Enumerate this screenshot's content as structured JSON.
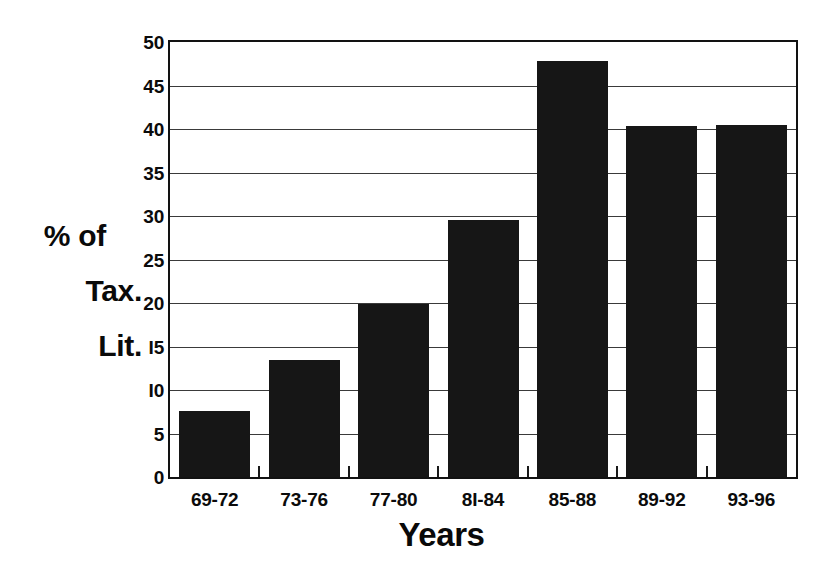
{
  "chart_data": {
    "type": "bar",
    "title": "",
    "subtitle": "",
    "xlabel": "Years",
    "ylabel": "% of Tax. Lit.",
    "ylabel_lines": [
      "% of",
      "Tax.",
      "Lit."
    ],
    "categories": [
      "69-72",
      "73-76",
      "77-80",
      "81-84",
      "85-88",
      "89-92",
      "93-96"
    ],
    "category_tick_labels": [
      "69-72",
      "73-76",
      "77-80",
      "8I-84",
      "85-88",
      "89-92",
      "93-96"
    ],
    "values": [
      7.6,
      13.5,
      19.9,
      29.6,
      47.8,
      40.4,
      40.5
    ],
    "ylim": [
      0,
      50
    ],
    "ytick_values": [
      0,
      5,
      10,
      15,
      20,
      25,
      30,
      35,
      40,
      45,
      50
    ],
    "ytick_labels": [
      "0",
      "5",
      "I0",
      "I5",
      "20",
      "25",
      "30",
      "35",
      "40",
      "45",
      "50"
    ],
    "grid": true,
    "grid_axis": "y",
    "legend": false,
    "legend_position": "none",
    "bar_color": "#161616",
    "grid_color": "#3a3a3a",
    "axis_color": "#121212",
    "background_color": "#ffffff"
  }
}
